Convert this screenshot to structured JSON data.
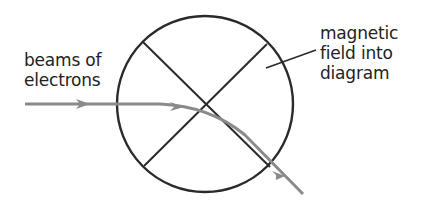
{
  "diagram": {
    "labels": {
      "beams": [
        "beams of",
        "electrons"
      ],
      "field": [
        "magnetic",
        "field into",
        "diagram"
      ]
    },
    "colors": {
      "outline": "#2a2a2a",
      "beam": "#8a8a8a",
      "text": "#222222",
      "background": "#ffffff"
    }
  }
}
